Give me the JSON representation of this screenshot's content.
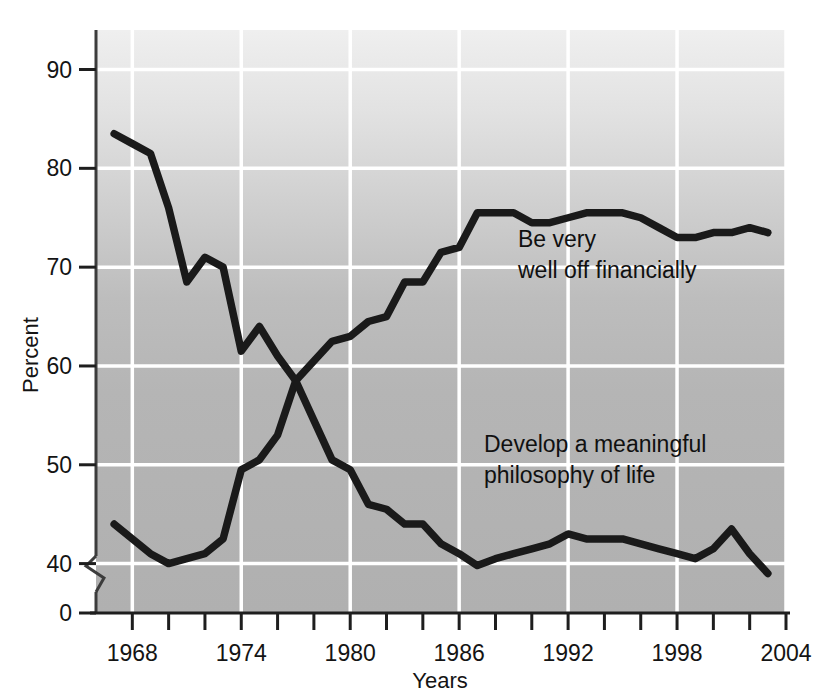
{
  "chart_data": {
    "type": "line",
    "title": "",
    "subtitle": "",
    "xlabel": "Years",
    "ylabel": "Percent",
    "xlim": [
      1966,
      2004
    ],
    "ylim": [
      35,
      94
    ],
    "yticks": [
      40,
      50,
      60,
      70,
      80,
      90
    ],
    "ytick_labels": [
      "40",
      "50",
      "60",
      "70",
      "80",
      "90"
    ],
    "y_axis_break": true,
    "y_origin_label": "0",
    "xticks": [
      1968,
      1970,
      1972,
      1974,
      1976,
      1978,
      1980,
      1982,
      1984,
      1986,
      1988,
      1990,
      1992,
      1994,
      1996,
      1998,
      2000,
      2002,
      2004
    ],
    "xtick_labels": [
      "1968",
      "",
      "",
      "1974",
      "",
      "",
      "1980",
      "",
      "",
      "1986",
      "",
      "",
      "1992",
      "",
      "",
      "1998",
      "",
      "",
      "2004"
    ],
    "major_xticks": [
      1968,
      1974,
      1980,
      1986,
      1992,
      1998,
      2004
    ],
    "major_xtick_labels": [
      "1968",
      "1974",
      "1980",
      "1986",
      "1992",
      "1998",
      "2004"
    ],
    "grid": true,
    "grid_color": "#ffffff",
    "plot_background": "#b9b9b9",
    "line_color": "#1a1a1a",
    "legend_position": "inline-annotation",
    "series": [
      {
        "name": "Be very well off financially",
        "label": "Be very\nwell off financially",
        "label_line1": "Be very",
        "label_line2": "well off financially",
        "x": [
          1967,
          1968,
          1969,
          1970,
          1971,
          1972,
          1973,
          1974,
          1975,
          1976,
          1977,
          1978,
          1979,
          1980,
          1981,
          1982,
          1983,
          1984,
          1985,
          1986,
          1987,
          1988,
          1989,
          1990,
          1991,
          1992,
          1993,
          1994,
          1995,
          1996,
          1997,
          1998,
          1999,
          2000,
          2001,
          2002,
          2003
        ],
        "values": [
          44.0,
          42.5,
          41.0,
          40.0,
          40.5,
          41.0,
          42.5,
          49.5,
          50.5,
          53.0,
          58.5,
          60.5,
          62.5,
          63.0,
          64.5,
          65.0,
          68.5,
          68.5,
          71.5,
          72.0,
          75.5,
          75.5,
          75.5,
          74.5,
          74.5,
          75.0,
          75.5,
          75.5,
          75.5,
          75.0,
          74.0,
          73.0,
          73.0,
          73.5,
          73.5,
          74.0,
          73.5
        ]
      },
      {
        "name": "Develop a meaningful philosophy of life",
        "label": "Develop a meaningful\nphilosophy of life",
        "label_line1": "Develop a meaningful",
        "label_line2": "philosophy of life",
        "x": [
          1967,
          1968,
          1969,
          1970,
          1971,
          1972,
          1973,
          1974,
          1975,
          1976,
          1977,
          1978,
          1979,
          1980,
          1981,
          1982,
          1983,
          1984,
          1985,
          1986,
          1987,
          1988,
          1989,
          1990,
          1991,
          1992,
          1993,
          1994,
          1995,
          1996,
          1997,
          1998,
          1999,
          2000,
          2001,
          2002,
          2003
        ],
        "values": [
          83.5,
          82.5,
          81.5,
          76.0,
          68.5,
          71.0,
          70.0,
          61.5,
          64.0,
          61.0,
          58.5,
          54.5,
          50.5,
          49.5,
          46.0,
          45.5,
          44.0,
          44.0,
          42.0,
          41.0,
          39.8,
          40.5,
          41.0,
          41.5,
          42.0,
          43.0,
          42.5,
          42.5,
          42.5,
          42.0,
          41.5,
          41.0,
          40.5,
          41.5,
          43.5,
          41.0,
          39.0
        ]
      }
    ],
    "annotations": [
      {
        "name": "be-very-well-off-label",
        "text_line1": "Be very",
        "text_line2": "well off financially",
        "x": 1987.2,
        "y": 70.6
      },
      {
        "name": "develop-philosophy-label",
        "text_line1": "Develop a meaningful",
        "text_line2": "philosophy of life",
        "x": 1985.0,
        "y": 49.0
      }
    ]
  }
}
